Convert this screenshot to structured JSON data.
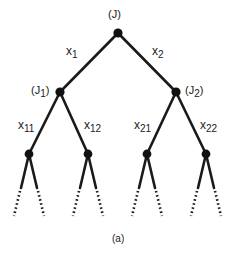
{
  "diagram": {
    "type": "decision-tree",
    "caption": "(a)",
    "colors": {
      "line": "#1a1a1a",
      "node": "#111111",
      "background": "#ffffff"
    },
    "nodes": [
      {
        "id": "J",
        "label": "(J)",
        "base": "(J",
        "sub": "",
        "close": ")",
        "x": 118,
        "y": 33
      },
      {
        "id": "J1",
        "label": "(J1)",
        "base": "(J",
        "sub": "1",
        "close": ")",
        "x": 60,
        "y": 92
      },
      {
        "id": "J2",
        "label": "(J2)",
        "base": "(J",
        "sub": "2",
        "close": ")",
        "x": 176,
        "y": 92
      },
      {
        "id": "L11",
        "label": "",
        "x": 29,
        "y": 154
      },
      {
        "id": "L12",
        "label": "",
        "x": 88,
        "y": 154
      },
      {
        "id": "L21",
        "label": "",
        "x": 147,
        "y": 154
      },
      {
        "id": "L22",
        "label": "",
        "x": 206,
        "y": 154
      }
    ],
    "edges": [
      {
        "from": "J",
        "to": "J1",
        "label": "x1",
        "base": "x",
        "sub": "1"
      },
      {
        "from": "J",
        "to": "J2",
        "label": "x2",
        "base": "x",
        "sub": "2"
      },
      {
        "from": "J1",
        "to": "L11",
        "label": "x11",
        "base": "x",
        "sub": "11"
      },
      {
        "from": "J1",
        "to": "L12",
        "label": "x12",
        "base": "x",
        "sub": "12"
      },
      {
        "from": "J2",
        "to": "L21",
        "label": "x21",
        "base": "x",
        "sub": "21"
      },
      {
        "from": "J2",
        "to": "L22",
        "label": "x22",
        "base": "x",
        "sub": "22"
      }
    ],
    "continuation": "dotted branches below each leaf node indicate the tree continues"
  }
}
